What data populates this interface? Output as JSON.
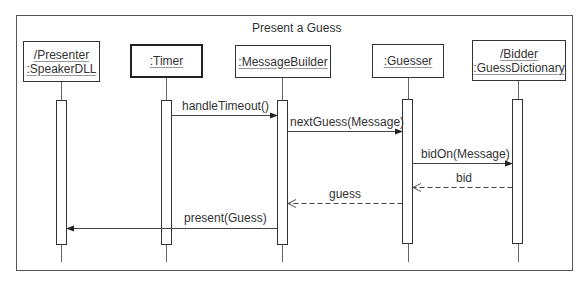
{
  "diagram": {
    "type": "UML sequence diagram",
    "title": "Present a Guess",
    "participants": [
      {
        "id": "presenter",
        "lines": [
          "/Presenter",
          ":SpeakerDLL"
        ],
        "active_object": false
      },
      {
        "id": "timer",
        "lines": [
          ":Timer"
        ],
        "active_object": true
      },
      {
        "id": "messagebuilder",
        "lines": [
          ":MessageBuilder"
        ],
        "active_object": false
      },
      {
        "id": "guesser",
        "lines": [
          ":Guesser"
        ],
        "active_object": false
      },
      {
        "id": "bidder",
        "lines": [
          "/Bidder",
          ":GuessDictionary"
        ],
        "active_object": false
      }
    ],
    "messages": [
      {
        "label": "handleTimeout()",
        "from": "timer",
        "to": "messagebuilder",
        "kind": "synchronous"
      },
      {
        "label": "nextGuess(Message)",
        "from": "messagebuilder",
        "to": "guesser",
        "kind": "synchronous"
      },
      {
        "label": "bidOn(Message)",
        "from": "guesser",
        "to": "bidder",
        "kind": "synchronous"
      },
      {
        "label": "bid",
        "from": "bidder",
        "to": "guesser",
        "kind": "return"
      },
      {
        "label": "guess",
        "from": "guesser",
        "to": "messagebuilder",
        "kind": "return"
      },
      {
        "label": "present(Guess)",
        "from": "messagebuilder",
        "to": "presenter",
        "kind": "synchronous"
      }
    ]
  }
}
